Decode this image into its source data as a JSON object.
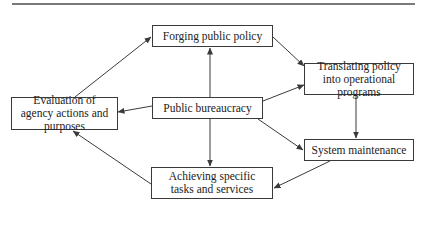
{
  "diagram": {
    "type": "flow",
    "nodes": {
      "forging": {
        "label": "Forging public policy"
      },
      "translating": {
        "label": "Translating policy into operational programs"
      },
      "evaluation": {
        "label": "Evaluation of agency actions and purposes"
      },
      "bureaucracy": {
        "label": "Public bureaucracy"
      },
      "maintenance": {
        "label": "System maintenance"
      },
      "achieving": {
        "label": "Achieving specific tasks and services"
      }
    },
    "edges": [
      {
        "from": "bureaucracy",
        "to": "forging"
      },
      {
        "from": "bureaucracy",
        "to": "translating"
      },
      {
        "from": "bureaucracy",
        "to": "maintenance"
      },
      {
        "from": "bureaucracy",
        "to": "achieving"
      },
      {
        "from": "bureaucracy",
        "to": "evaluation"
      },
      {
        "from": "forging",
        "to": "translating"
      },
      {
        "from": "translating",
        "to": "maintenance"
      },
      {
        "from": "maintenance",
        "to": "achieving"
      },
      {
        "from": "achieving",
        "to": "evaluation"
      },
      {
        "from": "evaluation",
        "to": "forging"
      }
    ],
    "colors": {
      "line": "#3a3a3a",
      "rule": "#7a7a7a",
      "text": "#222222",
      "background": "#ffffff"
    }
  }
}
